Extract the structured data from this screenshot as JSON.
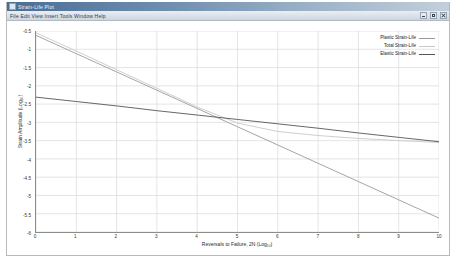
{
  "window": {
    "title": "Strain-Life Plot",
    "toolbar_text": "File  Edit  View  Insert  Tools  Window  Help",
    "buttons": {
      "minimize": "Minimize",
      "maximize": "Maximize",
      "close": "Close"
    }
  },
  "colors": {
    "plastic": "#9a9a9a",
    "total": "#c8c8c8",
    "elastic": "#555555",
    "grid": "#d8d8d8",
    "axis": "#6b6b6b",
    "plot_background": "#ffffff",
    "titlebar_start": "#4a6d93",
    "titlebar_end": "#c3cfdb"
  },
  "chart_data": {
    "type": "line",
    "title": "",
    "xlabel": "Reversals to Failure, 2N (Log₁₀)",
    "ylabel": "Strain Amplitude (Log₁₀)",
    "xlim": [
      0,
      10
    ],
    "ylim": [
      -6.0,
      -0.5
    ],
    "grid": true,
    "legend_position": "top-right-inside",
    "xticks": [
      0,
      1,
      2,
      3,
      4,
      5,
      6,
      7,
      8,
      9,
      10
    ],
    "xticklabels": [
      "0",
      "1",
      "2",
      "3",
      "4",
      "5",
      "6",
      "7",
      "8",
      "9",
      "10"
    ],
    "yticks": [
      -0.5,
      -1.0,
      -1.5,
      -2.0,
      -2.5,
      -3.0,
      -3.5,
      -4.0,
      -4.5,
      -5.0,
      -5.5,
      -6.0
    ],
    "yticklabels": [
      "-0.5",
      "-1",
      "-1.5",
      "-2",
      "-2.5",
      "-3",
      "-3.5",
      "-4",
      "-4.5",
      "-5",
      "-5.5",
      "-6"
    ],
    "x": [
      0,
      1,
      2,
      3,
      4,
      5,
      6,
      7,
      8,
      9,
      10
    ],
    "series": [
      {
        "name": "Plastic Strain-Life",
        "color": "#9a9a9a",
        "values": [
          -0.62,
          -1.12,
          -1.62,
          -2.12,
          -2.62,
          -3.12,
          -3.62,
          -4.12,
          -4.62,
          -5.12,
          -5.62
        ]
      },
      {
        "name": "Total Strain-Life",
        "color": "#c8c8c8",
        "values": [
          -0.55,
          -1.05,
          -1.56,
          -2.07,
          -2.58,
          -3.02,
          -3.25,
          -3.36,
          -3.44,
          -3.5,
          -3.55
        ]
      },
      {
        "name": "Elastic Strain-Life",
        "color": "#555555",
        "values": [
          -2.31,
          -2.43,
          -2.55,
          -2.68,
          -2.8,
          -2.92,
          -3.04,
          -3.16,
          -3.29,
          -3.41,
          -3.53
        ]
      }
    ]
  }
}
